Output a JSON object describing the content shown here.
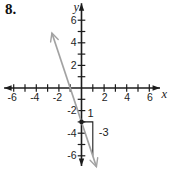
{
  "problem_number": "8.",
  "chart_data": {
    "type": "line",
    "title": "",
    "xlabel": "x",
    "ylabel": "y",
    "xlim": [
      -7,
      7
    ],
    "ylim": [
      -7,
      7
    ],
    "x_axis_draw": [
      -6.85,
      6.95
    ],
    "y_axis_draw": [
      -6.9,
      7.5
    ],
    "grid": false,
    "tick_step": 1,
    "tick_range": [
      -6,
      6
    ],
    "x_tick_labels": [
      "-6",
      "-4",
      "-2",
      "2",
      "4",
      "6"
    ],
    "x_tick_values": [
      -6,
      -4,
      -2,
      2,
      4,
      6
    ],
    "y_tick_labels": [
      "-6",
      "-4",
      "-2",
      "2",
      "4",
      "6"
    ],
    "y_tick_values": [
      -6,
      -4,
      -2,
      2,
      4,
      6
    ],
    "series": [
      {
        "name": "graphed-line",
        "slope": -3,
        "y_intercept": -3,
        "x_intercept": -1,
        "points": [
          [
            -1,
            0
          ],
          [
            0,
            -3
          ],
          [
            1,
            -6
          ]
        ],
        "draw_from": [
          -2.62,
          4.86
        ],
        "draw_to": [
          1.32,
          -6.96
        ],
        "arrows": "both",
        "color": "#a2a2a2"
      }
    ],
    "marked_point": {
      "x": 0,
      "y": -3
    },
    "slope_triangle": {
      "start": [
        0,
        -3
      ],
      "corner": [
        1,
        -3
      ],
      "end": [
        1,
        -6
      ],
      "run": 1,
      "rise": -3,
      "run_label": "1",
      "rise_label": "-3"
    },
    "axis_color": "#1c1c1c",
    "label_color": "#1c1c1c",
    "legend": false
  }
}
